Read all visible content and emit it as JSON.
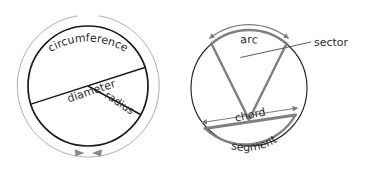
{
  "diagram": {
    "colors": {
      "outline_dark": "#1a1a1a",
      "thin_gray": "#9a9a9a",
      "mid_gray": "#7d7d7d",
      "text": "#2b2b2b",
      "background": "#ffffff"
    },
    "left_figure": {
      "name": "circle-with-diameter-and-radius",
      "center": {
        "x": 88,
        "y": 86
      },
      "radius": 60,
      "outer_arc_radius": 71,
      "labels": {
        "circumference": "circumference",
        "diameter": "diameter",
        "radius": "radius"
      },
      "circumference_arrows": 2
    },
    "right_figure": {
      "name": "circle-with-arc-sector-chord-segment",
      "center": {
        "x": 249,
        "y": 88
      },
      "radius": 58,
      "labels": {
        "arc": "arc",
        "sector": "sector",
        "chord": "chord",
        "segment": "segment"
      },
      "sector_apex": {
        "x": 249,
        "y": 119
      },
      "arc_arrows": 2,
      "chord_arrows": 2
    }
  }
}
